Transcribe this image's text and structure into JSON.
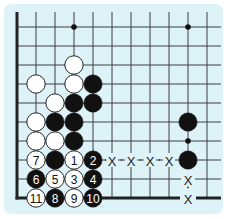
{
  "diagram": {
    "colors": {
      "board": "#def3f8",
      "line": "#3a3f42",
      "black_stone": "#111111",
      "white_stone": "#ffffff",
      "stone_outline": "#222222"
    },
    "grid": {
      "x_positions": [
        17,
        36,
        55,
        74,
        93,
        112,
        131,
        150,
        169,
        188,
        207
      ],
      "y_positions": [
        27,
        46,
        65,
        84,
        103,
        122,
        141,
        160,
        179,
        198
      ],
      "left_edge": "thick",
      "bottom_edge": "thick"
    },
    "star_points": [
      {
        "col": 3,
        "row": 0
      },
      {
        "col": 9,
        "row": 0
      },
      {
        "col": 9,
        "row": 6
      }
    ],
    "stones": [
      {
        "color": "white",
        "col": 3,
        "row": 2,
        "label": ""
      },
      {
        "color": "white",
        "col": 1,
        "row": 3,
        "label": ""
      },
      {
        "color": "white",
        "col": 3,
        "row": 3,
        "label": ""
      },
      {
        "color": "black",
        "col": 4,
        "row": 3,
        "label": ""
      },
      {
        "color": "white",
        "col": 2,
        "row": 4,
        "label": ""
      },
      {
        "color": "black",
        "col": 3,
        "row": 4,
        "label": ""
      },
      {
        "color": "black",
        "col": 4,
        "row": 4,
        "label": ""
      },
      {
        "color": "white",
        "col": 1,
        "row": 5,
        "label": ""
      },
      {
        "color": "black",
        "col": 2,
        "row": 5,
        "label": ""
      },
      {
        "color": "black",
        "col": 3,
        "row": 5,
        "label": ""
      },
      {
        "color": "white",
        "col": 1,
        "row": 6,
        "label": ""
      },
      {
        "color": "white",
        "col": 2,
        "row": 6,
        "label": ""
      },
      {
        "color": "black",
        "col": 3,
        "row": 6,
        "label": ""
      },
      {
        "color": "white",
        "col": 1,
        "row": 7,
        "label": "7"
      },
      {
        "color": "black",
        "col": 2,
        "row": 7,
        "label": ""
      },
      {
        "color": "white",
        "col": 3,
        "row": 7,
        "label": "1"
      },
      {
        "color": "black",
        "col": 4,
        "row": 7,
        "label": "2"
      },
      {
        "color": "black",
        "col": 1,
        "row": 8,
        "label": "6"
      },
      {
        "color": "white",
        "col": 2,
        "row": 8,
        "label": "5"
      },
      {
        "color": "white",
        "col": 3,
        "row": 8,
        "label": "3"
      },
      {
        "color": "black",
        "col": 4,
        "row": 8,
        "label": "4"
      },
      {
        "color": "white",
        "col": 1,
        "row": 9,
        "label": "11"
      },
      {
        "color": "black",
        "col": 2,
        "row": 9,
        "label": "8"
      },
      {
        "color": "white",
        "col": 3,
        "row": 9,
        "label": "9"
      },
      {
        "color": "black",
        "col": 4,
        "row": 9,
        "label": "10"
      },
      {
        "color": "black",
        "col": 9,
        "row": 5,
        "label": ""
      },
      {
        "color": "black",
        "col": 9,
        "row": 7,
        "label": ""
      }
    ],
    "marks": [
      {
        "type": "X",
        "col": 5,
        "row": 7,
        "label": "X"
      },
      {
        "type": "X",
        "col": 6,
        "row": 7,
        "label": "X"
      },
      {
        "type": "X",
        "col": 7,
        "row": 7,
        "label": "X"
      },
      {
        "type": "X",
        "col": 8,
        "row": 7,
        "label": "X"
      },
      {
        "type": "X",
        "col": 9,
        "row": 8,
        "label": "X"
      },
      {
        "type": "X",
        "col": 9,
        "row": 9,
        "label": "X"
      }
    ]
  }
}
